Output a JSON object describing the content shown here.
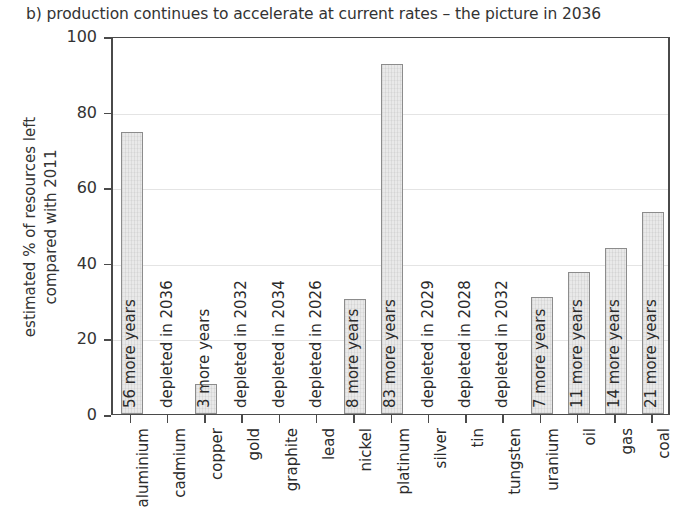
{
  "chart_data": {
    "type": "bar",
    "title": "b) production continues to accelerate at current rates – the picture in 2036",
    "xlabel": "",
    "ylabel": "estimated % of resources left compared with 2011",
    "ylabel_lines": [
      "estimated % of resources left",
      "compared with 2011"
    ],
    "ylim": [
      0,
      100
    ],
    "yticks": [
      0,
      20,
      40,
      60,
      80,
      100
    ],
    "grid": true,
    "legend": "none",
    "categories": [
      "aluminium",
      "cadmium",
      "copper",
      "gold",
      "graphite",
      "lead",
      "nickel",
      "platinum",
      "silver",
      "tin",
      "tungsten",
      "uranium",
      "oil",
      "gas",
      "coal"
    ],
    "values": [
      74.5,
      0,
      8,
      0,
      0,
      0,
      30.5,
      92.5,
      0,
      0,
      0,
      31,
      37.5,
      44,
      53.5
    ],
    "annotations": [
      "56 more years",
      "depleted in 2036",
      "3 more years",
      "depleted in 2032",
      "depleted in 2034",
      "depleted in 2026",
      "8 more years",
      "83 more years",
      "depleted in 2029",
      "depleted in 2028",
      "depleted in 2032",
      "7 more years",
      "11 more years",
      "14 more years",
      "21 more years"
    ],
    "bar_color": "#e9e9e9",
    "bar_edge_color": "#8c8c8c",
    "axis_color": "#4a4a4a",
    "grid_color": "#e4e4e4"
  }
}
